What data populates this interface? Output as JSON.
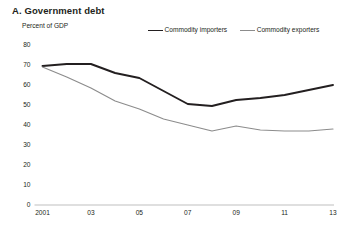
{
  "panel": {
    "title": "A. Government debt",
    "y_axis_label": "Percent of GDP"
  },
  "legend": {
    "position": "top-center",
    "items": [
      {
        "label": "Commodity importers",
        "color": "#231f20",
        "name": "commodity-importers"
      },
      {
        "label": "Commodity exporters",
        "color": "#8c8c8c",
        "name": "commodity-exporters"
      }
    ]
  },
  "axes": {
    "y_ticks": [
      "80",
      "70",
      "60",
      "50",
      "40",
      "30",
      "20",
      "10",
      "0"
    ],
    "x_ticks": [
      "2001",
      "03",
      "05",
      "07",
      "09",
      "11",
      "13"
    ]
  },
  "colors": {
    "importers_line": "#231f20",
    "exporters_line": "#8c8c8c",
    "axis_line": "#bfbfbf",
    "text": "#231f20",
    "background": "#ffffff"
  },
  "chart_data": {
    "type": "line",
    "title": "A. Government debt",
    "xlabel": "",
    "ylabel": "Percent of GDP",
    "ylim": [
      0,
      80
    ],
    "xlim": [
      2001,
      2013
    ],
    "ytick_values": [
      0,
      10,
      20,
      30,
      40,
      50,
      60,
      70,
      80
    ],
    "xtick_values": [
      2001,
      2003,
      2005,
      2007,
      2009,
      2011,
      2013
    ],
    "xtick_labels": [
      "2001",
      "03",
      "05",
      "07",
      "09",
      "11",
      "13"
    ],
    "grid": false,
    "legend_position": "top-center",
    "x": [
      2001,
      2002,
      2003,
      2004,
      2005,
      2006,
      2007,
      2008,
      2009,
      2010,
      2011,
      2012,
      2013
    ],
    "series": [
      {
        "name": "Commodity importers",
        "color": "#231f20",
        "values": [
          69.5,
          70.5,
          70.5,
          66.0,
          63.5,
          57.0,
          50.5,
          49.5,
          52.5,
          53.5,
          55.0,
          57.5,
          60.0
        ]
      },
      {
        "name": "Commodity exporters",
        "color": "#8c8c8c",
        "values": [
          69.0,
          64.0,
          58.5,
          52.0,
          48.0,
          43.0,
          40.0,
          37.0,
          39.5,
          37.5,
          37.0,
          37.0,
          38.0
        ]
      }
    ]
  }
}
